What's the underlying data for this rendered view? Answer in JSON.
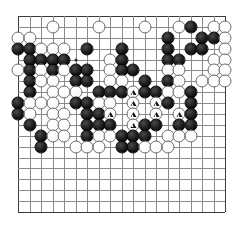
{
  "app": {
    "title": "Go Board Diagram",
    "board_size": 19,
    "colors": {
      "background": "#ffffff",
      "grid": "#8a8a8a",
      "edge": "#3a3a3a",
      "black_stone": "#000000",
      "white_stone": "#ffffff",
      "mark": "#111111"
    }
  },
  "board": {
    "size": 19,
    "origin_x": 18,
    "origin_y": 16,
    "spacing": 11.5,
    "star_points": [
      {
        "col": 5,
        "row": 4
      },
      {
        "col": 9,
        "row": 4
      },
      {
        "col": 13,
        "row": 4
      },
      {
        "col": 5,
        "row": 12
      },
      {
        "col": 9,
        "row": 12
      },
      {
        "col": 13,
        "row": 12
      }
    ],
    "stones": [
      {
        "col": 3,
        "row": 1,
        "color": "white"
      },
      {
        "col": 7,
        "row": 1,
        "color": "white"
      },
      {
        "col": 11,
        "row": 1,
        "color": "white"
      },
      {
        "col": 14,
        "row": 1,
        "color": "white"
      },
      {
        "col": 15,
        "row": 1,
        "color": "black"
      },
      {
        "col": 17,
        "row": 1,
        "color": "white"
      },
      {
        "col": 18,
        "row": 1,
        "color": "white"
      },
      {
        "col": 0,
        "row": 2,
        "color": "white"
      },
      {
        "col": 1,
        "row": 2,
        "color": "white"
      },
      {
        "col": 13,
        "row": 2,
        "color": "black"
      },
      {
        "col": 16,
        "row": 2,
        "color": "black"
      },
      {
        "col": 17,
        "row": 2,
        "color": "black"
      },
      {
        "col": 18,
        "row": 2,
        "color": "white"
      },
      {
        "col": 0,
        "row": 3,
        "color": "black"
      },
      {
        "col": 1,
        "row": 3,
        "color": "black"
      },
      {
        "col": 2,
        "row": 3,
        "color": "white"
      },
      {
        "col": 3,
        "row": 3,
        "color": "white"
      },
      {
        "col": 4,
        "row": 3,
        "color": "white"
      },
      {
        "col": 6,
        "row": 3,
        "color": "black"
      },
      {
        "col": 9,
        "row": 3,
        "color": "black"
      },
      {
        "col": 13,
        "row": 3,
        "color": "black"
      },
      {
        "col": 15,
        "row": 3,
        "color": "black"
      },
      {
        "col": 16,
        "row": 3,
        "color": "black"
      },
      {
        "col": 18,
        "row": 3,
        "color": "white"
      },
      {
        "col": 1,
        "row": 4,
        "color": "black"
      },
      {
        "col": 2,
        "row": 4,
        "color": "black"
      },
      {
        "col": 3,
        "row": 4,
        "color": "black"
      },
      {
        "col": 4,
        "row": 4,
        "color": "black"
      },
      {
        "col": 8,
        "row": 4,
        "color": "white"
      },
      {
        "col": 9,
        "row": 4,
        "color": "black"
      },
      {
        "col": 13,
        "row": 4,
        "color": "black"
      },
      {
        "col": 14,
        "row": 4,
        "color": "black"
      },
      {
        "col": 17,
        "row": 4,
        "color": "white"
      },
      {
        "col": 18,
        "row": 4,
        "color": "white"
      },
      {
        "col": 0,
        "row": 5,
        "color": "white"
      },
      {
        "col": 1,
        "row": 5,
        "color": "black"
      },
      {
        "col": 2,
        "row": 5,
        "color": "white"
      },
      {
        "col": 3,
        "row": 5,
        "color": "black"
      },
      {
        "col": 4,
        "row": 5,
        "color": "white"
      },
      {
        "col": 5,
        "row": 5,
        "color": "black"
      },
      {
        "col": 6,
        "row": 5,
        "color": "black"
      },
      {
        "col": 8,
        "row": 5,
        "color": "white"
      },
      {
        "col": 9,
        "row": 5,
        "color": "black"
      },
      {
        "col": 10,
        "row": 5,
        "color": "black"
      },
      {
        "col": 13,
        "row": 5,
        "color": "white"
      },
      {
        "col": 14,
        "row": 5,
        "color": "white"
      },
      {
        "col": 17,
        "row": 5,
        "color": "white"
      },
      {
        "col": 18,
        "row": 5,
        "color": "white"
      },
      {
        "col": 1,
        "row": 6,
        "color": "black"
      },
      {
        "col": 2,
        "row": 6,
        "color": "white"
      },
      {
        "col": 3,
        "row": 6,
        "color": "white"
      },
      {
        "col": 5,
        "row": 6,
        "color": "black"
      },
      {
        "col": 6,
        "row": 6,
        "color": "black"
      },
      {
        "col": 8,
        "row": 6,
        "color": "white"
      },
      {
        "col": 9,
        "row": 6,
        "color": "white"
      },
      {
        "col": 11,
        "row": 6,
        "color": "black"
      },
      {
        "col": 13,
        "row": 6,
        "color": "black"
      },
      {
        "col": 14,
        "row": 6,
        "color": "white"
      },
      {
        "col": 16,
        "row": 6,
        "color": "white"
      },
      {
        "col": 17,
        "row": 6,
        "color": "white"
      },
      {
        "col": 18,
        "row": 6,
        "color": "white"
      },
      {
        "col": 1,
        "row": 7,
        "color": "black"
      },
      {
        "col": 3,
        "row": 7,
        "color": "white"
      },
      {
        "col": 4,
        "row": 7,
        "color": "white"
      },
      {
        "col": 5,
        "row": 7,
        "color": "white"
      },
      {
        "col": 7,
        "row": 7,
        "color": "black"
      },
      {
        "col": 8,
        "row": 7,
        "color": "black"
      },
      {
        "col": 9,
        "row": 7,
        "color": "black"
      },
      {
        "col": 10,
        "row": 7,
        "color": "white",
        "mark": "triangle"
      },
      {
        "col": 11,
        "row": 7,
        "color": "black"
      },
      {
        "col": 12,
        "row": 7,
        "color": "black"
      },
      {
        "col": 13,
        "row": 7,
        "color": "white"
      },
      {
        "col": 14,
        "row": 7,
        "color": "white"
      },
      {
        "col": 15,
        "row": 7,
        "color": "black"
      },
      {
        "col": 0,
        "row": 8,
        "color": "black"
      },
      {
        "col": 1,
        "row": 8,
        "color": "white"
      },
      {
        "col": 2,
        "row": 8,
        "color": "white"
      },
      {
        "col": 3,
        "row": 8,
        "color": "white"
      },
      {
        "col": 5,
        "row": 8,
        "color": "black"
      },
      {
        "col": 6,
        "row": 8,
        "color": "black"
      },
      {
        "col": 7,
        "row": 8,
        "color": "white"
      },
      {
        "col": 8,
        "row": 8,
        "color": "white"
      },
      {
        "col": 10,
        "row": 8,
        "color": "white",
        "mark": "triangle"
      },
      {
        "col": 12,
        "row": 8,
        "color": "white",
        "mark": "triangle"
      },
      {
        "col": 13,
        "row": 8,
        "color": "black"
      },
      {
        "col": 15,
        "row": 8,
        "color": "black"
      },
      {
        "col": 0,
        "row": 9,
        "color": "black"
      },
      {
        "col": 1,
        "row": 9,
        "color": "white"
      },
      {
        "col": 3,
        "row": 9,
        "color": "white"
      },
      {
        "col": 4,
        "row": 9,
        "color": "white"
      },
      {
        "col": 6,
        "row": 9,
        "color": "black"
      },
      {
        "col": 7,
        "row": 9,
        "color": "black"
      },
      {
        "col": 8,
        "row": 9,
        "color": "white",
        "mark": "triangle"
      },
      {
        "col": 10,
        "row": 9,
        "color": "white",
        "mark": "triangle"
      },
      {
        "col": 12,
        "row": 9,
        "color": "white",
        "mark": "triangle"
      },
      {
        "col": 14,
        "row": 9,
        "color": "white",
        "mark": "triangle"
      },
      {
        "col": 15,
        "row": 9,
        "color": "black"
      },
      {
        "col": 1,
        "row": 10,
        "color": "black"
      },
      {
        "col": 3,
        "row": 10,
        "color": "white"
      },
      {
        "col": 4,
        "row": 10,
        "color": "white"
      },
      {
        "col": 6,
        "row": 10,
        "color": "black"
      },
      {
        "col": 7,
        "row": 10,
        "color": "black"
      },
      {
        "col": 8,
        "row": 10,
        "color": "black"
      },
      {
        "col": 10,
        "row": 10,
        "color": "white",
        "mark": "triangle"
      },
      {
        "col": 11,
        "row": 10,
        "color": "black"
      },
      {
        "col": 12,
        "row": 10,
        "color": "black"
      },
      {
        "col": 14,
        "row": 10,
        "color": "black"
      },
      {
        "col": 15,
        "row": 10,
        "color": "black"
      },
      {
        "col": 2,
        "row": 11,
        "color": "black"
      },
      {
        "col": 3,
        "row": 11,
        "color": "white"
      },
      {
        "col": 4,
        "row": 11,
        "color": "white"
      },
      {
        "col": 6,
        "row": 11,
        "color": "black"
      },
      {
        "col": 7,
        "row": 11,
        "color": "white"
      },
      {
        "col": 8,
        "row": 11,
        "color": "white"
      },
      {
        "col": 9,
        "row": 11,
        "color": "black"
      },
      {
        "col": 10,
        "row": 11,
        "color": "black"
      },
      {
        "col": 11,
        "row": 11,
        "color": "black"
      },
      {
        "col": 13,
        "row": 11,
        "color": "white"
      },
      {
        "col": 14,
        "row": 11,
        "color": "white"
      },
      {
        "col": 15,
        "row": 11,
        "color": "white"
      },
      {
        "col": 2,
        "row": 12,
        "color": "black"
      },
      {
        "col": 5,
        "row": 12,
        "color": "white"
      },
      {
        "col": 6,
        "row": 12,
        "color": "white"
      },
      {
        "col": 7,
        "row": 12,
        "color": "white"
      },
      {
        "col": 9,
        "row": 12,
        "color": "black"
      },
      {
        "col": 10,
        "row": 12,
        "color": "black"
      },
      {
        "col": 11,
        "row": 12,
        "color": "white"
      },
      {
        "col": 12,
        "row": 12,
        "color": "white"
      },
      {
        "col": 13,
        "row": 12,
        "color": "white"
      }
    ]
  },
  "legend": {
    "mark_name": "triangle",
    "mark_meaning": "marked white stones"
  }
}
